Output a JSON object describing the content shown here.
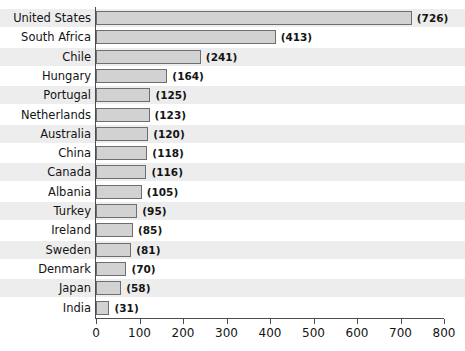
{
  "chart_data": {
    "type": "bar",
    "orientation": "horizontal",
    "title": "",
    "subtitle": "",
    "xlabel": "",
    "ylabel": "",
    "xlim": [
      0,
      800
    ],
    "xticks": [
      0,
      100,
      200,
      300,
      400,
      500,
      600,
      700,
      800
    ],
    "grid": false,
    "legend": null,
    "value_label_format": "(value)",
    "categories": [
      "United States",
      "South Africa",
      "Chile",
      "Hungary",
      "Portugal",
      "Netherlands",
      "Australia",
      "China",
      "Canada",
      "Albania",
      "Turkey",
      "Ireland",
      "Sweden",
      "Denmark",
      "Japan",
      "India"
    ],
    "values": [
      726,
      413,
      241,
      164,
      125,
      123,
      120,
      118,
      116,
      105,
      95,
      85,
      81,
      70,
      58,
      31
    ],
    "value_labels": [
      "(726)",
      "(413)",
      "(241)",
      "(164)",
      "(125)",
      "(123)",
      "(120)",
      "(118)",
      "(116)",
      "(105)",
      "(95)",
      "(85)",
      "(81)",
      "(70)",
      "(58)",
      "(31)"
    ],
    "tick_labels": [
      "0",
      "100",
      "200",
      "300",
      "400",
      "500",
      "600",
      "700",
      "800"
    ]
  },
  "style": {
    "bar_fill": "#d2d2d2",
    "bar_stroke": "#6e6e6e",
    "band_color": "#ededed",
    "axis_color": "#4d4d4d",
    "text_color": "#141414",
    "background": "#ffffff"
  }
}
